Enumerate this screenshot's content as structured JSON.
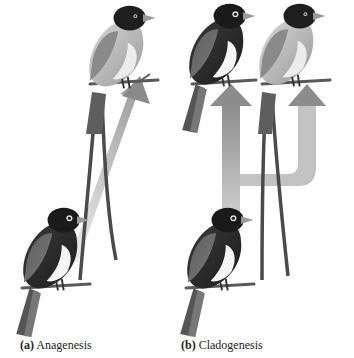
{
  "figure": {
    "panels": [
      {
        "id": "a",
        "letter": "(a)",
        "title": "Anagenesis",
        "description": "Single lineage: ancestral dark-bodied bird at bottom transforms along a diagonal arrow into a descendant bird with long tail streamers at top."
      },
      {
        "id": "b",
        "letter": "(b)",
        "title": "Cladogenesis",
        "description": "Branching lineage: ancestral bird at bottom; arrow splits into two upward arrows leading to two descendant birds (one dark-bodied, one pale-bodied with long tail streamers)."
      }
    ],
    "colors": {
      "background": "#ffffff",
      "arrow": "#b8b8b8",
      "arrow_dark": "#8a8a8a",
      "bird_dark": "#2a2a2a",
      "bird_mid": "#6a6a6a",
      "bird_light": "#c9c9c9",
      "breast_white": "#f2f2f2",
      "branch": "#5a5a5a",
      "caption_text": "#222222"
    }
  }
}
